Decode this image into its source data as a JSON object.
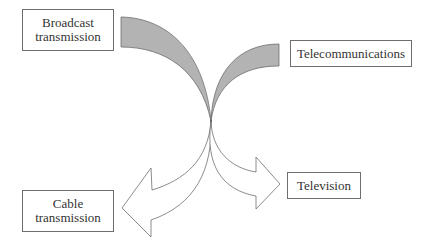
{
  "diagram": {
    "type": "convergence-flow",
    "colors": {
      "input_fill": "#b3b3b3",
      "stroke": "#6e6e6e",
      "output_fill": "#ffffff",
      "text": "#333333"
    },
    "inputs": [
      {
        "id": "broadcast",
        "label_line1": "Broadcast",
        "label_line2": "transmission"
      },
      {
        "id": "telecom",
        "label_line1": "Telecommunications"
      }
    ],
    "outputs": [
      {
        "id": "cable",
        "label_line1": "Cable",
        "label_line2": "transmission"
      },
      {
        "id": "tv",
        "label_line1": "Television"
      }
    ],
    "edges": [
      {
        "from": "broadcast",
        "to": "convergence-point",
        "style": "shaded-band"
      },
      {
        "from": "telecom",
        "to": "convergence-point",
        "style": "shaded-band"
      },
      {
        "from": "convergence-point",
        "to": "cable",
        "style": "hollow-arrow"
      },
      {
        "from": "convergence-point",
        "to": "tv",
        "style": "hollow-arrow"
      }
    ]
  }
}
